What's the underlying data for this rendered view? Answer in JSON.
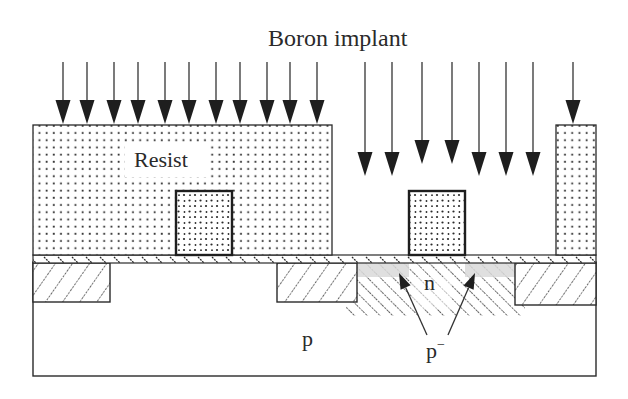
{
  "title": "Boron implant",
  "labels": {
    "resist": "Resist",
    "n_region": "n",
    "p_substrate": "p",
    "p_minus": "p",
    "p_minus_sup": "−"
  },
  "colors": {
    "line": "#2a2a2a",
    "background": "#ffffff",
    "shallow_band": "#d9d9d9",
    "arrow_fill": "#1e1e1e"
  },
  "layers": [
    {
      "name": "p-substrate",
      "x": 33,
      "y": 262,
      "w": 563,
      "h": 114
    },
    {
      "name": "gate-oxide",
      "x": 33,
      "y": 255,
      "w": 563,
      "h": 8
    },
    {
      "name": "field-oxide-left",
      "x": 33,
      "y": 263,
      "w": 77,
      "h": 39
    },
    {
      "name": "field-oxide-middle",
      "x": 277,
      "y": 263,
      "w": 80,
      "h": 39
    },
    {
      "name": "field-oxide-right",
      "x": 515,
      "y": 263,
      "w": 81,
      "h": 42
    },
    {
      "name": "resist-left",
      "x": 33,
      "y": 125,
      "w": 299,
      "h": 130
    },
    {
      "name": "resist-right",
      "x": 556,
      "y": 125,
      "w": 40,
      "h": 130
    },
    {
      "name": "poly-gate-left",
      "x": 176,
      "y": 191,
      "w": 56,
      "h": 64
    },
    {
      "name": "poly-gate-right",
      "x": 409,
      "y": 191,
      "w": 56,
      "h": 64
    },
    {
      "name": "p-minus-implant",
      "x": 346,
      "y": 263,
      "w": 179,
      "h": 53
    }
  ],
  "implant_arrows": {
    "on_resist_left": {
      "x": [
        63,
        87,
        114,
        138,
        165,
        189,
        216,
        240,
        267,
        290,
        317
      ],
      "y_start": 62,
      "y_tip": 124
    },
    "through_opening": {
      "x": [
        365,
        392,
        422,
        452,
        479,
        506,
        533
      ],
      "y_start": 62,
      "y_tip": [
        176,
        176,
        164,
        164,
        176,
        176,
        176
      ]
    },
    "on_resist_right": {
      "x": [
        573
      ],
      "y_start": 62,
      "y_tip": 124
    }
  },
  "pointer_arrows": [
    {
      "from": [
        427,
        335
      ],
      "to": [
        399,
        273
      ]
    },
    {
      "from": [
        448,
        335
      ],
      "to": [
        475,
        273
      ]
    }
  ]
}
